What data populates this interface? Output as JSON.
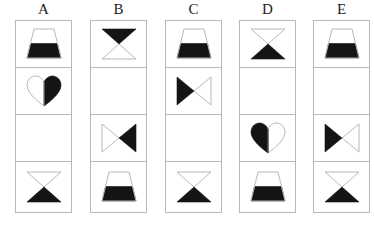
{
  "figure": {
    "kind": "visual-analogy-shape-matrix",
    "background_color": "#ffffff",
    "ink_color": "#141414",
    "outline_color": "#b8b8b8",
    "fill_color": "#141414",
    "columns": [
      {
        "label": "A",
        "cells": [
          {
            "shape": "trapezoid",
            "fill": "bottom-half",
            "name": "shape-trapezoid-bottom-filled"
          },
          {
            "shape": "heart",
            "fill": "right-half",
            "name": "shape-heart-right-filled"
          },
          {
            "shape": "none",
            "fill": "none",
            "name": "empty-cell"
          },
          {
            "shape": "hourglass-vertical",
            "fill": "bottom-triangle",
            "name": "shape-hourglass-bottom-filled"
          }
        ]
      },
      {
        "label": "B",
        "cells": [
          {
            "shape": "hourglass-vertical",
            "fill": "top-triangle",
            "name": "shape-hourglass-top-filled"
          },
          {
            "shape": "none",
            "fill": "none",
            "name": "empty-cell"
          },
          {
            "shape": "bowtie-horizontal",
            "fill": "right-triangle",
            "name": "shape-bowtie-right-filled"
          },
          {
            "shape": "trapezoid",
            "fill": "bottom-half",
            "name": "shape-trapezoid-bottom-filled"
          }
        ]
      },
      {
        "label": "C",
        "cells": [
          {
            "shape": "trapezoid",
            "fill": "bottom-half",
            "name": "shape-trapezoid-bottom-filled"
          },
          {
            "shape": "bowtie-horizontal",
            "fill": "left-triangle",
            "name": "shape-bowtie-left-filled"
          },
          {
            "shape": "none",
            "fill": "none",
            "name": "empty-cell"
          },
          {
            "shape": "hourglass-vertical",
            "fill": "bottom-triangle",
            "name": "shape-hourglass-bottom-filled"
          }
        ]
      },
      {
        "label": "D",
        "cells": [
          {
            "shape": "hourglass-vertical",
            "fill": "bottom-triangle",
            "name": "shape-hourglass-bottom-filled"
          },
          {
            "shape": "none",
            "fill": "none",
            "name": "empty-cell"
          },
          {
            "shape": "heart",
            "fill": "left-half",
            "name": "shape-heart-left-filled"
          },
          {
            "shape": "trapezoid",
            "fill": "bottom-half",
            "name": "shape-trapezoid-bottom-filled"
          }
        ]
      },
      {
        "label": "E",
        "cells": [
          {
            "shape": "trapezoid",
            "fill": "bottom-half",
            "name": "shape-trapezoid-bottom-filled"
          },
          {
            "shape": "none",
            "fill": "none",
            "name": "empty-cell"
          },
          {
            "shape": "bowtie-horizontal",
            "fill": "left-triangle",
            "name": "shape-bowtie-left-filled"
          },
          {
            "shape": "hourglass-vertical",
            "fill": "bottom-triangle",
            "name": "shape-hourglass-bottom-filled"
          }
        ]
      }
    ]
  }
}
